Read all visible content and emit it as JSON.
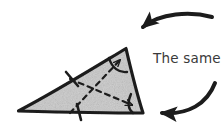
{
  "figure": {
    "background_color": "#ffffff",
    "ink_color": "#1c1c1c",
    "fill_color": "#c8c8c8",
    "text_color": "#3a3a3a"
  },
  "annotation": {
    "label": "The same!",
    "x": 153,
    "y": 63
  },
  "shape": {
    "name": "triangle",
    "kind": "scalene-triangle",
    "fill": "#c8c8c8",
    "stroke": "#1c1c1c",
    "stroke_width": 3.2,
    "vertices": [
      {
        "name": "left-vertex",
        "x": 18,
        "y": 111
      },
      {
        "name": "top-vertex",
        "x": 126,
        "y": 48
      },
      {
        "name": "bottom-right-vertex",
        "x": 143,
        "y": 113
      }
    ]
  },
  "marks": {
    "tick_marks": [
      {
        "name": "tick-upper-left-side",
        "x": 72,
        "y": 79,
        "angle": -62
      },
      {
        "name": "tick-bottom-side",
        "x": 79,
        "y": 112,
        "angle": -10
      }
    ],
    "angle_arcs": [
      {
        "name": "angle-arc-top-vertex",
        "x": 126,
        "y": 48
      },
      {
        "name": "angle-arc-bottom-right-vertex",
        "x": 143,
        "y": 113
      }
    ],
    "dashed_connectors": [
      {
        "name": "dashed-arrow-angles",
        "from_x": 72,
        "from_y": 111,
        "to_x": 121,
        "to_y": 58
      },
      {
        "name": "dashed-arrow-sides",
        "from_x": 72,
        "from_y": 80,
        "to_x": 131,
        "to_y": 104
      }
    ]
  },
  "callouts": [
    {
      "name": "callout-arrow-top",
      "description": "curved arrow pointing down-left at the top vertex",
      "tail_x": 212,
      "tail_y": 17,
      "head_x": 124,
      "head_y": 43
    },
    {
      "name": "callout-arrow-bottom-right",
      "description": "curved arrow pointing left at the bottom-right vertex",
      "tail_x": 215,
      "tail_y": 83,
      "head_x": 148,
      "head_y": 113
    }
  ]
}
